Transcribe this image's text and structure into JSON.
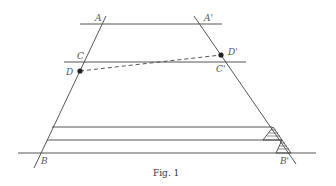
{
  "figure": {
    "caption": "Fig. 1",
    "labels": {
      "A": "A",
      "A_prime": "A'",
      "C": "C",
      "C_prime": "C'",
      "D": "D",
      "D_prime": "D'",
      "B": "B",
      "B_prime": "B'"
    },
    "colors": {
      "line": "#444444",
      "label": "#555555",
      "background": "#ffffff"
    }
  }
}
